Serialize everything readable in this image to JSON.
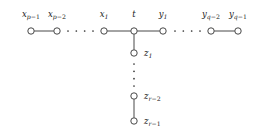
{
  "figure": {
    "type": "graph-diagram",
    "background_color": "#ffffff",
    "stroke_color": "#333333",
    "node_fill": "#ffffff",
    "node_radius": 3.2
  },
  "nodes": [
    {
      "id": "xp1",
      "label_base": "x",
      "label_sub": "p",
      "label_sub_tail": "−1",
      "cx": 31,
      "cy": 31,
      "label_x": 31,
      "label_y": 10,
      "align": "center"
    },
    {
      "id": "xp2",
      "label_base": "x",
      "label_sub": "p",
      "label_sub_tail": "−2",
      "cx": 57,
      "cy": 31,
      "label_x": 57,
      "label_y": 10,
      "align": "center"
    },
    {
      "id": "x1",
      "label_base": "x",
      "label_sub": "1",
      "label_sub_tail": "",
      "cx": 104,
      "cy": 31,
      "label_x": 104,
      "label_y": 10,
      "align": "center"
    },
    {
      "id": "t",
      "label_base": "t",
      "label_sub": "",
      "label_sub_tail": "",
      "cx": 134,
      "cy": 31,
      "label_x": 134,
      "label_y": 10,
      "align": "center"
    },
    {
      "id": "y1",
      "label_base": "y",
      "label_sub": "1",
      "label_sub_tail": "",
      "cx": 163,
      "cy": 31,
      "label_x": 163,
      "label_y": 10,
      "align": "center"
    },
    {
      "id": "yq2",
      "label_base": "y",
      "label_sub": "q",
      "label_sub_tail": "−2",
      "cx": 211,
      "cy": 31,
      "label_x": 211,
      "label_y": 10,
      "align": "center"
    },
    {
      "id": "yq1",
      "label_base": "y",
      "label_sub": "q",
      "label_sub_tail": "−1",
      "cx": 238,
      "cy": 31,
      "label_x": 238,
      "label_y": 10,
      "align": "center"
    },
    {
      "id": "z1",
      "label_base": "z",
      "label_sub": "1",
      "label_sub_tail": "",
      "cx": 134,
      "cy": 53,
      "label_x": 144,
      "label_y": 49,
      "align": "left"
    },
    {
      "id": "zr2",
      "label_base": "z",
      "label_sub": "r",
      "label_sub_tail": "−2",
      "cx": 134,
      "cy": 96,
      "label_x": 144,
      "label_y": 92,
      "align": "left"
    },
    {
      "id": "zr1",
      "label_base": "z",
      "label_sub": "r",
      "label_sub_tail": "−1",
      "cx": 134,
      "cy": 121,
      "label_x": 144,
      "label_y": 117,
      "align": "left"
    }
  ],
  "edges": [
    {
      "from": "xp1",
      "to": "xp2",
      "orientation": "horizontal"
    },
    {
      "from": "x1",
      "to": "t",
      "orientation": "horizontal"
    },
    {
      "from": "t",
      "to": "y1",
      "orientation": "horizontal"
    },
    {
      "from": "yq2",
      "to": "yq1",
      "orientation": "horizontal"
    },
    {
      "from": "t",
      "to": "z1",
      "orientation": "vertical"
    },
    {
      "from": "zr2",
      "to": "zr1",
      "orientation": "vertical"
    }
  ],
  "ellipses": [
    {
      "id": "ellipsis-x-path",
      "orientation": "horizontal",
      "dots": 4,
      "x_start": 68,
      "x_end": 93,
      "y": 31
    },
    {
      "id": "ellipsis-y-path",
      "orientation": "horizontal",
      "dots": 4,
      "x_start": 175,
      "x_end": 200,
      "y": 31
    },
    {
      "id": "ellipsis-z-path",
      "orientation": "vertical",
      "dots": 4,
      "y_start": 64,
      "y_end": 86,
      "x": 134
    }
  ]
}
